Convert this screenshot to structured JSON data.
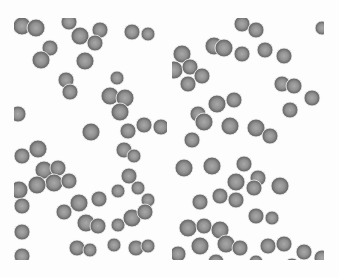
{
  "image": {
    "description": "Grayscale micrograph of red blood cells, two panels side by side",
    "colors": {
      "background": "#fdfdfd",
      "cell_rim": "#6e6e6e",
      "cell_center": "#a8a8a8"
    }
  },
  "panels": [
    {
      "name": "left",
      "cells": [
        [
          8,
          8,
          9
        ],
        [
          22,
          10,
          9
        ],
        [
          55,
          4,
          8
        ],
        [
          66,
          18,
          9
        ],
        [
          86,
          12,
          8
        ],
        [
          118,
          14,
          8
        ],
        [
          134,
          16,
          7
        ],
        [
          36,
          30,
          8
        ],
        [
          27,
          42,
          9
        ],
        [
          71,
          43,
          9
        ],
        [
          81,
          25,
          8
        ],
        [
          52,
          62,
          8
        ],
        [
          56,
          74,
          8
        ],
        [
          103,
          60,
          7
        ],
        [
          96,
          78,
          9
        ],
        [
          111,
          80,
          9
        ],
        [
          106,
          94,
          9
        ],
        [
          4,
          96,
          8
        ],
        [
          77,
          114,
          9
        ],
        [
          114,
          113,
          8
        ],
        [
          130,
          107,
          8
        ],
        [
          147,
          109,
          8
        ],
        [
          24,
          131,
          9
        ],
        [
          8,
          138,
          8
        ],
        [
          110,
          132,
          8
        ],
        [
          120,
          138,
          7
        ],
        [
          30,
          152,
          9
        ],
        [
          44,
          150,
          8
        ],
        [
          40,
          165,
          9
        ],
        [
          55,
          163,
          8
        ],
        [
          23,
          167,
          9
        ],
        [
          5,
          172,
          9
        ],
        [
          65,
          185,
          9
        ],
        [
          85,
          181,
          8
        ],
        [
          104,
          173,
          7
        ],
        [
          115,
          158,
          8
        ],
        [
          124,
          170,
          7
        ],
        [
          134,
          182,
          7
        ],
        [
          50,
          194,
          8
        ],
        [
          8,
          188,
          8
        ],
        [
          8,
          214,
          8
        ],
        [
          72,
          205,
          9
        ],
        [
          84,
          208,
          8
        ],
        [
          104,
          207,
          7
        ],
        [
          118,
          200,
          9
        ],
        [
          131,
          194,
          8
        ],
        [
          122,
          230,
          8
        ],
        [
          8,
          238,
          8
        ],
        [
          63,
          230,
          8
        ],
        [
          76,
          232,
          7
        ],
        [
          100,
          227,
          7
        ],
        [
          134,
          228,
          7
        ]
      ]
    },
    {
      "name": "right",
      "cells": [
        [
          70,
          6,
          8
        ],
        [
          84,
          12,
          8
        ],
        [
          150,
          10,
          7
        ],
        [
          42,
          28,
          9
        ],
        [
          52,
          30,
          9
        ],
        [
          10,
          36,
          9
        ],
        [
          70,
          36,
          8
        ],
        [
          93,
          32,
          8
        ],
        [
          112,
          38,
          8
        ],
        [
          2,
          52,
          9
        ],
        [
          18,
          49,
          8
        ],
        [
          30,
          58,
          8
        ],
        [
          16,
          66,
          8
        ],
        [
          110,
          66,
          8
        ],
        [
          122,
          68,
          8
        ],
        [
          140,
          80,
          8
        ],
        [
          62,
          82,
          8
        ],
        [
          45,
          86,
          9
        ],
        [
          26,
          96,
          8
        ],
        [
          118,
          92,
          8
        ],
        [
          32,
          104,
          9
        ],
        [
          58,
          108,
          9
        ],
        [
          84,
          110,
          9
        ],
        [
          98,
          118,
          8
        ],
        [
          12,
          150,
          9
        ],
        [
          20,
          122,
          8
        ],
        [
          40,
          148,
          9
        ],
        [
          72,
          146,
          8
        ],
        [
          86,
          160,
          8
        ],
        [
          64,
          164,
          9
        ],
        [
          82,
          170,
          8
        ],
        [
          108,
          168,
          9
        ],
        [
          48,
          178,
          8
        ],
        [
          28,
          184,
          8
        ],
        [
          64,
          182,
          8
        ],
        [
          84,
          198,
          8
        ],
        [
          100,
          200,
          7
        ],
        [
          16,
          210,
          9
        ],
        [
          32,
          208,
          8
        ],
        [
          48,
          212,
          9
        ],
        [
          54,
          226,
          9
        ],
        [
          68,
          230,
          8
        ],
        [
          28,
          228,
          9
        ],
        [
          44,
          244,
          8
        ],
        [
          96,
          228,
          8
        ],
        [
          112,
          226,
          8
        ],
        [
          132,
          234,
          8
        ],
        [
          6,
          236,
          8
        ],
        [
          120,
          248,
          8
        ],
        [
          84,
          244,
          7
        ],
        [
          150,
          240,
          8
        ]
      ]
    }
  ]
}
